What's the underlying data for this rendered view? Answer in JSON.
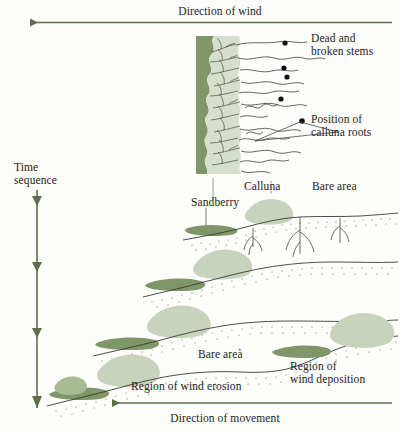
{
  "figure": {
    "type": "ecological-process-diagram",
    "background_color": "#fdfdfb",
    "ink_color": "#1c1c1c",
    "arrow_color": "#5a7048",
    "dark_green": "#7f9668",
    "mid_green": "#8fa87a",
    "light_green": "#c7d4bb",
    "pale_green": "#d5dfcb",
    "line_color": "#3a3a3a"
  },
  "labels": {
    "direction_of_wind": "Direction of wind",
    "direction_of_movement": "Direction of movement",
    "time_sequence_line1": "Time",
    "time_sequence_line2": "sequence",
    "dead_stems_line1": "Dead and",
    "dead_stems_line2": "broken stems",
    "calluna_roots_line1": "Position of",
    "calluna_roots_line2": "calluna roots",
    "calluna": "Calluna",
    "sandberry": "Sandberry",
    "bare_area_top": "Bare area",
    "bare_area_bottom": "Bare areà",
    "region_wind_erosion": "Region of wind erosion",
    "region_wind_deposition_line1": "Region of",
    "region_wind_deposition_line2": "wind deposition"
  },
  "icons": {
    "wind_arrow": "arrow-left-icon",
    "movement_arrow": "arrow-left-icon",
    "time_arrow": "arrow-down-icon",
    "root_marker": "black-dot-icon",
    "leader": "leader-line-icon"
  },
  "stages": [
    {
      "name": "stage-1-detail-cross-section",
      "order": 1
    },
    {
      "name": "stage-2-dune",
      "order": 2
    },
    {
      "name": "stage-3-dune",
      "order": 3
    },
    {
      "name": "stage-4-dune",
      "order": 4
    },
    {
      "name": "stage-5-dune",
      "order": 5
    }
  ]
}
